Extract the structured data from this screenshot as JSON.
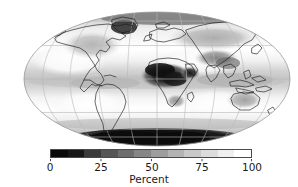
{
  "figure": {
    "kind": "global-map-with-colorbar",
    "background_color": "#ffffff"
  },
  "map": {
    "projection": "Mollweide",
    "graticule": {
      "meridian_interval_deg": 30,
      "parallel_interval_deg": 30,
      "line_color": "#b9b9b9"
    },
    "coastline_color": "#1c1c1c",
    "outline_color": "#9a9a9a"
  },
  "colorbar": {
    "orientation": "horizontal",
    "label": "Percent",
    "min": 0,
    "max": 100,
    "tick_values": [
      0,
      25,
      50,
      75,
      100
    ],
    "tick_labels": [
      "0",
      "25",
      "50",
      "75",
      "100"
    ],
    "colormap": "grayscale",
    "segment_colors": [
      "#0a0a0a",
      "#171717",
      "#3a3a3a",
      "#555555",
      "#6e6e6e",
      "#868686",
      "#9d9d9d",
      "#b3b3b3",
      "#c8c8c8",
      "#dcdcdc",
      "#efefef",
      "#ffffff"
    ],
    "frame_color": "#4a4a4a"
  },
  "chart_data": {
    "type": "heatmap",
    "title": "",
    "xlabel": "",
    "ylabel": "",
    "colorbar_label": "Percent",
    "units": "Percent",
    "zlim": [
      0,
      100
    ],
    "legend_position": "bottom",
    "grid": true,
    "projection": "Mollweide",
    "ticks": [
      0,
      25,
      50,
      75,
      100
    ],
    "regions": [
      {
        "name": "Antarctica",
        "value": 5
      },
      {
        "name": "Sahara / North Africa",
        "value": 12
      },
      {
        "name": "Arabian Peninsula",
        "value": 18
      },
      {
        "name": "Central Asia / Tibet",
        "value": 30
      },
      {
        "name": "Greenland",
        "value": 15
      },
      {
        "name": "Northern Eurasia",
        "value": 45
      },
      {
        "name": "North America",
        "value": 55
      },
      {
        "name": "Amazon Basin",
        "value": 72
      },
      {
        "name": "Equatorial Pacific (ITCZ)",
        "value": 60
      },
      {
        "name": "Subtropical Oceans",
        "value": 90
      },
      {
        "name": "Southern Ocean",
        "value": 55
      },
      {
        "name": "Australia",
        "value": 48
      },
      {
        "name": "Maritime Continent",
        "value": 62
      }
    ]
  }
}
